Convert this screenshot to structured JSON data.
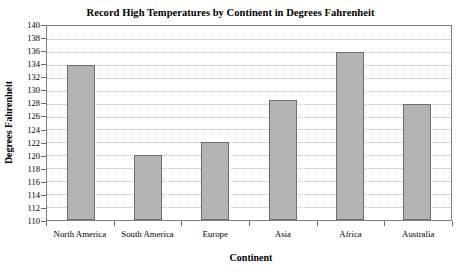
{
  "chart_data": {
    "type": "bar",
    "title": "Record High Temperatures by Continent in Degrees Fahrenheit",
    "xlabel": "Continent",
    "ylabel": "Degrees Fahrenheit",
    "categories": [
      "North America",
      "South America",
      "Europe",
      "Asia",
      "Africa",
      "Australia"
    ],
    "values": [
      134,
      120,
      122,
      128.5,
      136,
      128
    ],
    "ylim": [
      110,
      140
    ],
    "ytick_step": 2,
    "yticks": [
      140,
      138,
      136,
      134,
      132,
      130,
      128,
      126,
      124,
      122,
      120,
      118,
      116,
      114,
      112,
      110
    ],
    "grid": true,
    "grid_axis": "y",
    "grid_style": "dotted",
    "legend": "none",
    "bar_color": "#b4b4b4",
    "bar_border_color": "#6e6e6e",
    "frame_color": "#808080"
  }
}
